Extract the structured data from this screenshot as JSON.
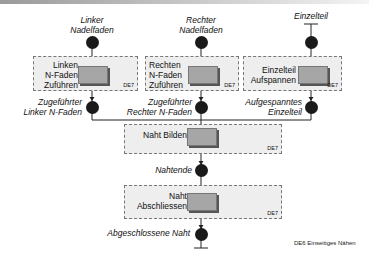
{
  "title_footer": "DE6 Einseitiges Nähen",
  "inputs": [
    {
      "line1": "Linker",
      "line2": "Nadelfaden"
    },
    {
      "line1": "Rechter",
      "line2": "Nadelfaden"
    },
    {
      "line1": "Einzelteil"
    }
  ],
  "activities": [
    {
      "lines": [
        "Linken",
        "N-Faden",
        "Zuführen"
      ],
      "tag": "DE7"
    },
    {
      "lines": [
        "Rechten",
        "N-Faden",
        "Zuführen"
      ],
      "tag": "DE7"
    },
    {
      "lines": [
        "Einzelteil",
        "Aufspannen"
      ],
      "tag": "DE7"
    },
    {
      "lines": [
        "Naht Bilden"
      ],
      "tag": "DE7"
    },
    {
      "lines": [
        "Naht",
        "Abschliessen"
      ],
      "tag": "DE7"
    }
  ],
  "states": [
    {
      "line1": "Zugeführter",
      "line2": "Linker N-Faden"
    },
    {
      "line1": "Zugeführter",
      "line2": "Rechter N-Faden"
    },
    {
      "line1": "Aufgespanntes",
      "line2": "Einzelteil"
    },
    {
      "line1": "Nahtende"
    },
    {
      "line1": "Abgeschlossene Naht"
    }
  ]
}
